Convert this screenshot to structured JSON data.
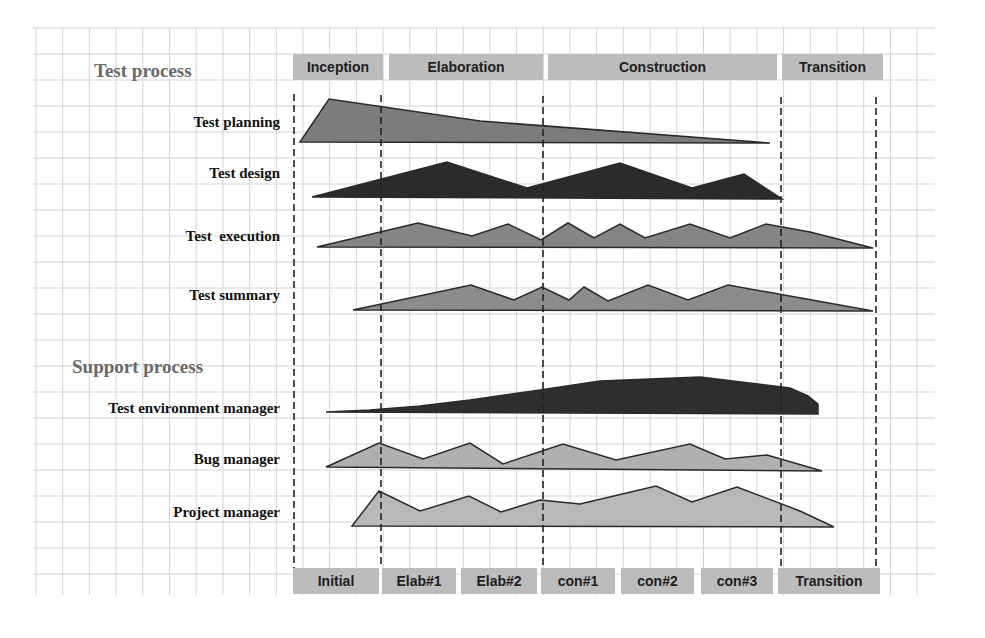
{
  "sections": {
    "test_process": "Test process",
    "support_process": "Support process"
  },
  "phases_top": [
    {
      "label": "Inception",
      "x": 293,
      "w": 90
    },
    {
      "label": "Elaboration",
      "x": 389,
      "w": 154
    },
    {
      "label": "Construction",
      "x": 548,
      "w": 229
    },
    {
      "label": "Transition",
      "x": 782,
      "w": 101
    }
  ],
  "iterations_bottom": [
    {
      "label": "Initial",
      "x": 293,
      "w": 86
    },
    {
      "label": "Elab#1",
      "x": 382,
      "w": 74
    },
    {
      "label": "Elab#2",
      "x": 461,
      "w": 76
    },
    {
      "label": "con#1",
      "x": 541,
      "w": 74
    },
    {
      "label": "con#2",
      "x": 621,
      "w": 73
    },
    {
      "label": "con#3",
      "x": 701,
      "w": 72
    },
    {
      "label": "Transition",
      "x": 778,
      "w": 102
    }
  ],
  "rows": [
    {
      "label": "Test planning",
      "y": 124,
      "color": "#7c7c7c"
    },
    {
      "label": "Test design",
      "y": 175,
      "color": "#2b2b2b"
    },
    {
      "label": "Test  execution",
      "y": 238,
      "color": "#858585"
    },
    {
      "label": "Test summary",
      "y": 297,
      "color": "#8c8c8c"
    },
    {
      "label": "Test environment manager",
      "y": 410,
      "color": "#2e2e2e"
    },
    {
      "label": "Bug manager",
      "y": 461,
      "color": "#b0b0b0"
    },
    {
      "label": "Project manager",
      "y": 514,
      "color": "#b8b8b8"
    }
  ],
  "shapes": [
    "300,142 329,99 480,121 770,143",
    "312,197 447,162 527,188 620,163 692,188 744,174 782,199",
    "317,247 418,223 472,236 508,224 541,240 568,223 594,238 620,224 645,238 690,224 730,238 766,224 810,232 873,248",
    "353,310 471,285 514,300 542,287 569,300 584,287 608,301 648,285 688,300 728,285 873,311",
    "326,412 370,410 420,406 470,400 540,390 600,381 700,377 790,388 808,396 818,404 818,414",
    "326,467 379,443 423,459 470,443 503,464 563,444 616,460 690,444 725,459 767,455 822,471",
    "352,526 379,491 420,511 469,496 501,512 540,500 580,504 656,486 692,502 737,487 800,511 834,527"
  ],
  "dashed_lines": [
    {
      "x": 294,
      "y1": 94,
      "y2": 568
    },
    {
      "x": 381,
      "y1": 95,
      "y2": 568
    },
    {
      "x": 543,
      "y1": 96,
      "y2": 568
    },
    {
      "x": 781,
      "y1": 97,
      "y2": 568
    },
    {
      "x": 876,
      "y1": 97,
      "y2": 568
    }
  ]
}
